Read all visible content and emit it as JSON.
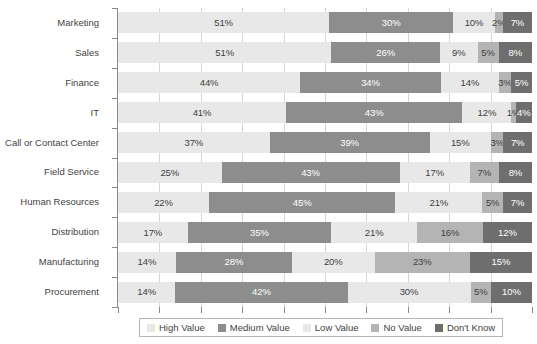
{
  "chart_data": {
    "type": "bar",
    "orientation": "horizontal",
    "stacked": true,
    "normalized_percent": true,
    "title": "",
    "subtitle": "",
    "xlabel": "",
    "ylabel": "",
    "xlim": [
      0,
      100
    ],
    "grid": true,
    "grid_axis": "x",
    "gridline_values": [
      10,
      20,
      30,
      40,
      50,
      60,
      70,
      80,
      90
    ],
    "xtick_values": [
      0,
      10,
      20,
      30,
      40,
      50,
      60,
      70,
      80,
      90,
      100
    ],
    "xtick_labels": [],
    "legend_position": "bottom",
    "categories": [
      "Marketing",
      "Sales",
      "Finance",
      "IT",
      "Call or Contact Center",
      "Field Service",
      "Human Resources",
      "Distribution",
      "Manufacturing",
      "Procurement"
    ],
    "series": [
      {
        "name": "High Value",
        "color": "#e8e8e8",
        "label_color": "#3f3f3f",
        "values": [
          51,
          51,
          44,
          41,
          37,
          25,
          22,
          17,
          14,
          14
        ],
        "labels": [
          "51%",
          "51%",
          "44%",
          "41%",
          "37%",
          "25%",
          "22%",
          "17%",
          "14%",
          "14%"
        ]
      },
      {
        "name": "Medium Value",
        "color": "#8d8d8d",
        "label_color": "#ffffff",
        "values": [
          30,
          26,
          34,
          43,
          39,
          43,
          45,
          35,
          28,
          42
        ],
        "labels": [
          "30%",
          "26%",
          "34%",
          "43%",
          "39%",
          "43%",
          "45%",
          "35%",
          "28%",
          "42%"
        ]
      },
      {
        "name": "Low Value",
        "color": "#e8e8e8",
        "label_color": "#3f3f3f",
        "values": [
          10,
          9,
          14,
          12,
          15,
          17,
          21,
          21,
          20,
          30
        ],
        "labels": [
          "10%",
          "9%",
          "14%",
          "12%",
          "15%",
          "17%",
          "21%",
          "21%",
          "20%",
          "30%"
        ]
      },
      {
        "name": "No Value",
        "color": "#b4b4b4",
        "label_color": "#3f3f3f",
        "values": [
          2,
          5,
          3,
          1,
          3,
          7,
          5,
          16,
          23,
          5
        ],
        "labels": [
          "2%",
          "5%",
          "3%",
          "1%",
          "3%",
          "7%",
          "5%",
          "16%",
          "23%",
          "5%"
        ]
      },
      {
        "name": "Don't Know",
        "color": "#6e6e6e",
        "label_color": "#ffffff",
        "values": [
          7,
          8,
          5,
          4,
          7,
          8,
          7,
          12,
          15,
          10
        ],
        "labels": [
          "7%",
          "8%",
          "5%",
          "4%",
          "7%",
          "8%",
          "7%",
          "12%",
          "15%",
          "10%"
        ]
      }
    ]
  },
  "legend": {
    "items": [
      {
        "label": "High Value",
        "color": "#e8e8e8"
      },
      {
        "label": "Medium Value",
        "color": "#8d8d8d"
      },
      {
        "label": "Low Value",
        "color": "#e8e8e8"
      },
      {
        "label": "No Value",
        "color": "#b4b4b4"
      },
      {
        "label": "Don't Know",
        "color": "#6e6e6e"
      }
    ]
  },
  "colors": {
    "high_value": "#e8e8e8",
    "medium_value": "#8d8d8d",
    "low_value": "#e8e8e8",
    "no_value": "#b4b4b4",
    "dont_know": "#6e6e6e",
    "gridline": "#d6d6d6",
    "axis": "#8a8a8a",
    "text": "#3f3f3f",
    "background": "#ffffff"
  }
}
